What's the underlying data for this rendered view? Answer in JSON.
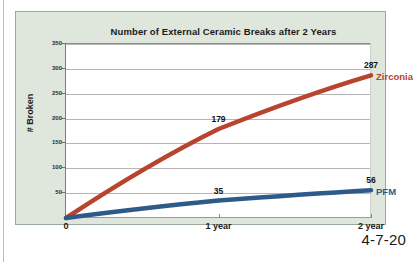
{
  "page": {
    "footer_date": "4-7-20"
  },
  "chart_data": {
    "type": "line",
    "title": "Number of External Ceramic Breaks after 2 Years",
    "xlabel": "",
    "ylabel": "# Broken",
    "x": [
      0,
      1,
      2
    ],
    "x_tick_labels": [
      "0",
      "1 year",
      "2 year"
    ],
    "ylim": [
      0,
      350
    ],
    "y_ticks": [
      0,
      50,
      100,
      150,
      200,
      250,
      300,
      350
    ],
    "y_tick_labels": [
      "0",
      "50",
      "100",
      "150",
      "200",
      "250",
      "300",
      "350"
    ],
    "grid": true,
    "legend_position": "right-inline",
    "series": [
      {
        "name": "Zirconia",
        "color": "#b8432e",
        "values": [
          0,
          179,
          287
        ],
        "point_labels": [
          "",
          "179",
          "287"
        ]
      },
      {
        "name": "PFM",
        "color": "#2e5a8a",
        "values": [
          0,
          35,
          56
        ],
        "point_labels": [
          "",
          "35",
          "56"
        ]
      }
    ]
  }
}
